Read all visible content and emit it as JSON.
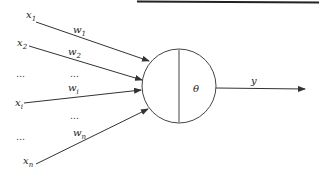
{
  "diagram": {
    "type": "perceptron-neuron",
    "inputs": [
      {
        "name": "x",
        "sub": "1",
        "weight": "w",
        "weight_sub": "1"
      },
      {
        "name": "x",
        "sub": "2",
        "weight": "w",
        "weight_sub": "2"
      },
      {
        "name": "x",
        "sub": "i",
        "weight": "w",
        "weight_sub": "i"
      },
      {
        "name": "x",
        "sub": "n",
        "weight": "w",
        "weight_sub": "n"
      }
    ],
    "ellipsis": "…",
    "neuron": {
      "threshold": "θ"
    },
    "output": {
      "label": "y"
    }
  }
}
